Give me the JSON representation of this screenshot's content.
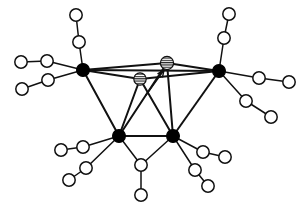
{
  "figure": {
    "caption": "",
    "background_color": "#ffffff",
    "line_color": "#111111",
    "width": 307,
    "height": 218
  },
  "legend": {
    "filled_node_label": "metal-center",
    "open_node_label": "ligand-atom",
    "hatched_node_label": "bridging-atom"
  },
  "chart_data": {
    "type": "diagram",
    "node_styles": {
      "filled": {
        "fill": "#000000",
        "stroke": "#111111",
        "stroke_width": 1.2,
        "radius": 6.2
      },
      "open": {
        "fill": "#ffffff",
        "stroke": "#111111",
        "stroke_width": 1.5,
        "radius": 6.0
      },
      "hatched": {
        "fill": "hatch-horizontal",
        "stroke": "#111111",
        "stroke_width": 1.2,
        "radius": 6.2
      }
    },
    "nodes": [
      {
        "id": "M1",
        "type": "filled",
        "x": 83,
        "y": 70,
        "r": 6.4
      },
      {
        "id": "M2",
        "type": "filled",
        "x": 219,
        "y": 71,
        "r": 6.4
      },
      {
        "id": "M3",
        "type": "filled",
        "x": 119,
        "y": 136,
        "r": 6.4
      },
      {
        "id": "M4",
        "type": "filled",
        "x": 173,
        "y": 136,
        "r": 6.4
      },
      {
        "id": "H1",
        "type": "hatched",
        "x": 140,
        "y": 79,
        "r": 6.2
      },
      {
        "id": "H2",
        "type": "hatched",
        "x": 167,
        "y": 63,
        "r": 6.6
      },
      {
        "id": "L1",
        "type": "open",
        "x": 76,
        "y": 15,
        "r": 6.2
      },
      {
        "id": "L2",
        "type": "open",
        "x": 79,
        "y": 42,
        "r": 6.2
      },
      {
        "id": "L3",
        "type": "open",
        "x": 47,
        "y": 61,
        "r": 6.2
      },
      {
        "id": "L4",
        "type": "open",
        "x": 21,
        "y": 62,
        "r": 6.2
      },
      {
        "id": "L5",
        "type": "open",
        "x": 48,
        "y": 80,
        "r": 6.2
      },
      {
        "id": "L6",
        "type": "open",
        "x": 22,
        "y": 89,
        "r": 6.2
      },
      {
        "id": "L7",
        "type": "open",
        "x": 229,
        "y": 14,
        "r": 6.2
      },
      {
        "id": "L8",
        "type": "open",
        "x": 224,
        "y": 38,
        "r": 6.2
      },
      {
        "id": "L9",
        "type": "open",
        "x": 259,
        "y": 78,
        "r": 6.2
      },
      {
        "id": "L10",
        "type": "open",
        "x": 289,
        "y": 82,
        "r": 6.2
      },
      {
        "id": "L11",
        "type": "open",
        "x": 246,
        "y": 101,
        "r": 6.2
      },
      {
        "id": "L12",
        "type": "open",
        "x": 271,
        "y": 117,
        "r": 6.2
      },
      {
        "id": "L13",
        "type": "open",
        "x": 83,
        "y": 147,
        "r": 6.2
      },
      {
        "id": "L14",
        "type": "open",
        "x": 61,
        "y": 150,
        "r": 6.2
      },
      {
        "id": "L15",
        "type": "open",
        "x": 86,
        "y": 168,
        "r": 6.2
      },
      {
        "id": "L16",
        "type": "open",
        "x": 69,
        "y": 180,
        "r": 6.2
      },
      {
        "id": "L17",
        "type": "open",
        "x": 141,
        "y": 165,
        "r": 6.2
      },
      {
        "id": "L18",
        "type": "open",
        "x": 141,
        "y": 195,
        "r": 6.2
      },
      {
        "id": "L19",
        "type": "open",
        "x": 203,
        "y": 152,
        "r": 6.2
      },
      {
        "id": "L20",
        "type": "open",
        "x": 225,
        "y": 157,
        "r": 6.2
      },
      {
        "id": "L21",
        "type": "open",
        "x": 195,
        "y": 170,
        "r": 6.2
      },
      {
        "id": "L22",
        "type": "open",
        "x": 208,
        "y": 186,
        "r": 6.2
      }
    ],
    "edges": [
      {
        "from": "M1",
        "to": "M2",
        "kind": "frame"
      },
      {
        "from": "M1",
        "to": "M3",
        "kind": "frame"
      },
      {
        "from": "M2",
        "to": "M4",
        "kind": "frame"
      },
      {
        "from": "M3",
        "to": "M4",
        "kind": "frame"
      },
      {
        "from": "M1",
        "to": "H1",
        "kind": "frame"
      },
      {
        "from": "M1",
        "to": "H2",
        "kind": "frame"
      },
      {
        "from": "M2",
        "to": "H1",
        "kind": "frame"
      },
      {
        "from": "M2",
        "to": "H2",
        "kind": "frame"
      },
      {
        "from": "H1",
        "to": "M3",
        "kind": "frame"
      },
      {
        "from": "H1",
        "to": "M4",
        "kind": "frame"
      },
      {
        "from": "H2",
        "to": "M3",
        "kind": "frame"
      },
      {
        "from": "H2",
        "to": "M4",
        "kind": "frame"
      },
      {
        "from": "M1",
        "to": "L2",
        "kind": "ligand"
      },
      {
        "from": "L2",
        "to": "L1",
        "kind": "ligand"
      },
      {
        "from": "M1",
        "to": "L3",
        "kind": "ligand"
      },
      {
        "from": "L3",
        "to": "L4",
        "kind": "ligand"
      },
      {
        "from": "M1",
        "to": "L5",
        "kind": "ligand"
      },
      {
        "from": "L5",
        "to": "L6",
        "kind": "ligand"
      },
      {
        "from": "M2",
        "to": "L8",
        "kind": "ligand"
      },
      {
        "from": "L8",
        "to": "L7",
        "kind": "ligand"
      },
      {
        "from": "M2",
        "to": "L9",
        "kind": "ligand"
      },
      {
        "from": "L9",
        "to": "L10",
        "kind": "ligand"
      },
      {
        "from": "M2",
        "to": "L11",
        "kind": "ligand"
      },
      {
        "from": "L11",
        "to": "L12",
        "kind": "ligand"
      },
      {
        "from": "M3",
        "to": "L13",
        "kind": "ligand"
      },
      {
        "from": "L13",
        "to": "L14",
        "kind": "ligand"
      },
      {
        "from": "M3",
        "to": "L15",
        "kind": "ligand"
      },
      {
        "from": "L15",
        "to": "L16",
        "kind": "ligand"
      },
      {
        "from": "M3",
        "to": "L17",
        "kind": "ligand"
      },
      {
        "from": "M4",
        "to": "L17",
        "kind": "ligand"
      },
      {
        "from": "L17",
        "to": "L18",
        "kind": "ligand"
      },
      {
        "from": "M4",
        "to": "L19",
        "kind": "ligand"
      },
      {
        "from": "L19",
        "to": "L20",
        "kind": "ligand"
      },
      {
        "from": "M4",
        "to": "L21",
        "kind": "ligand"
      },
      {
        "from": "L21",
        "to": "L22",
        "kind": "ligand"
      }
    ],
    "arrow": {
      "label": "pointer-arrow",
      "from_x": 146,
      "from_y": 95,
      "to_x": 164,
      "to_y": 70,
      "head_length": 7,
      "head_angle_deg": 24
    }
  }
}
